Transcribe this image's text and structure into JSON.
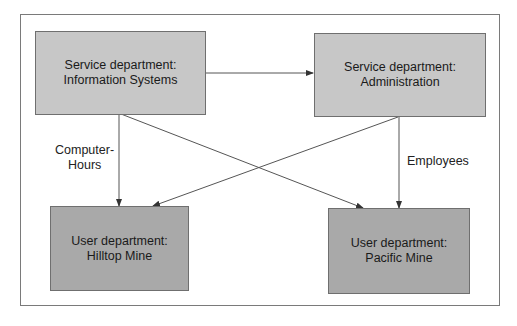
{
  "diagram": {
    "nodes": [
      {
        "id": "info_systems",
        "line1": "Service department:",
        "line2": "Information Systems",
        "type": "service"
      },
      {
        "id": "administration",
        "line1": "Service department:",
        "line2": "Administration",
        "type": "service"
      },
      {
        "id": "hilltop",
        "line1": "User department:",
        "line2": "Hilltop Mine",
        "type": "user"
      },
      {
        "id": "pacific",
        "line1": "User department:",
        "line2": "Pacific Mine",
        "type": "user"
      }
    ],
    "edges": [
      {
        "from": "info_systems",
        "to": "administration"
      },
      {
        "from": "info_systems",
        "to": "hilltop"
      },
      {
        "from": "info_systems",
        "to": "pacific"
      },
      {
        "from": "administration",
        "to": "hilltop"
      },
      {
        "from": "administration",
        "to": "pacific"
      }
    ],
    "labels": {
      "computer_hours_line1": "Computer-",
      "computer_hours_line2": "Hours",
      "employees": "Employees"
    },
    "colors": {
      "service_fill": "#c7c7c7",
      "user_fill": "#a9a9a9",
      "line": "#555555"
    }
  }
}
